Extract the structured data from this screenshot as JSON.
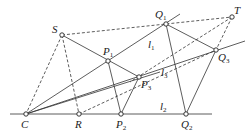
{
  "diagram": {
    "points": {
      "S": {
        "label": "S",
        "x": 62,
        "y": 35
      },
      "T": {
        "label": "T",
        "x": 232,
        "y": 17
      },
      "Q1": {
        "label": "Q",
        "sub": "1",
        "x": 166,
        "y": 24
      },
      "P1": {
        "label": "P",
        "sub": "1",
        "x": 108,
        "y": 61
      },
      "P3": {
        "label": "P",
        "sub": "3",
        "x": 139,
        "y": 77
      },
      "Q3": {
        "label": "Q",
        "sub": "3",
        "x": 216,
        "y": 50
      },
      "C": {
        "label": "C",
        "x": 26,
        "y": 114
      },
      "R": {
        "label": "R",
        "x": 79,
        "y": 114
      },
      "P2": {
        "label": "P",
        "sub": "2",
        "x": 121,
        "y": 114
      },
      "Q2": {
        "label": "Q",
        "sub": "2",
        "x": 186,
        "y": 114
      }
    },
    "line_labels": {
      "l1": {
        "label": "l",
        "sub": "1"
      },
      "l2": {
        "label": "l",
        "sub": "2"
      },
      "l3": {
        "label": "l",
        "sub": "3"
      }
    }
  }
}
